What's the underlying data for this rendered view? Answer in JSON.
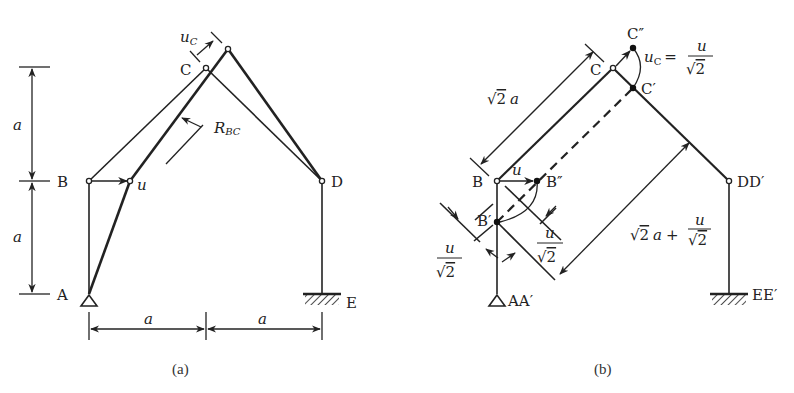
{
  "figure_a": {
    "caption": "(a)",
    "nodes": {
      "A": "A",
      "B": "B",
      "C": "C",
      "D": "D",
      "E": "E"
    },
    "labels": {
      "u": "u",
      "uC_main": "u",
      "uC_sub": "C",
      "R_main": "R",
      "R_sub": "BC",
      "dim_vertical_top": "a",
      "dim_vertical_bottom": "a",
      "dim_horizontal_left": "a",
      "dim_horizontal_right": "a"
    }
  },
  "figure_b": {
    "caption": "(b)",
    "nodes": {
      "B": "B",
      "B_double_prime": "B″",
      "B_prime": "B′",
      "C": "C",
      "C_double_prime": "C″",
      "C_prime": "C′",
      "DD_prime": "DD′",
      "AA_prime": "AA′",
      "EE_prime": "EE′"
    },
    "labels": {
      "u": "u",
      "uC_main": "u",
      "uC_sub": "C",
      "uC_equals": "=",
      "frac_num": "u",
      "frac_den": "2",
      "sqrt_symbol": "√",
      "dim_sqrt2a_sqrt": "√",
      "dim_sqrt2a_two": "2",
      "dim_sqrt2a_a": "a",
      "dim_long_sqrt": "√",
      "dim_long_two": "2",
      "dim_long_a": "a",
      "dim_long_plus": "+",
      "dim_long_frac_num": "u",
      "dim_long_frac_den": "2",
      "left_frac_num": "u",
      "left_frac_den": "2",
      "right_frac_num": "u",
      "right_frac_den": "2"
    }
  }
}
